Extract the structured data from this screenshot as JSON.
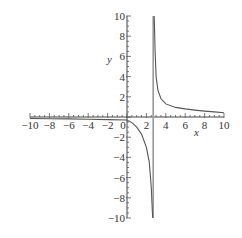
{
  "chart_data": {
    "type": "line",
    "title": "",
    "xlabel": "x",
    "ylabel": "y",
    "xlim": [
      -10,
      10
    ],
    "ylim": [
      -10,
      10
    ],
    "grid": false,
    "legend": null,
    "x_ticks": [
      -10,
      -8,
      -6,
      -4,
      -2,
      0,
      2,
      4,
      6,
      8,
      10
    ],
    "x_tick_labels": [
      "−10",
      "−8",
      "−6",
      "−4",
      "−2",
      "0",
      "2",
      "4",
      "6",
      "8",
      "10"
    ],
    "y_ticks": [
      -10,
      -8,
      -6,
      -4,
      -2,
      2,
      4,
      6,
      8,
      10
    ],
    "y_tick_labels": [
      "−10",
      "−8",
      "−6",
      "−4",
      "−2",
      "2",
      "4",
      "6",
      "8",
      "10"
    ],
    "vertical_asymptote_x": 2.7,
    "series": [
      {
        "name": "left-branch",
        "x": [
          -10,
          -8,
          -6,
          -4,
          -2,
          0,
          0.5,
          1.0,
          1.5,
          2.0,
          2.3,
          2.5,
          2.6,
          2.65
        ],
        "y": [
          -0.15,
          -0.17,
          -0.19,
          -0.22,
          -0.26,
          -0.3,
          -0.55,
          -1.0,
          -1.7,
          -3.0,
          -4.5,
          -7.0,
          -9.0,
          -10.0
        ]
      },
      {
        "name": "right-branch",
        "x": [
          2.8,
          2.85,
          2.9,
          3.0,
          3.2,
          3.5,
          4.0,
          5.0,
          6.0,
          7.0,
          8.0,
          9.0,
          10.0
        ],
        "y": [
          10.0,
          8.5,
          6.5,
          4.0,
          2.6,
          1.8,
          1.3,
          0.95,
          0.8,
          0.68,
          0.58,
          0.5,
          0.42
        ]
      }
    ]
  }
}
